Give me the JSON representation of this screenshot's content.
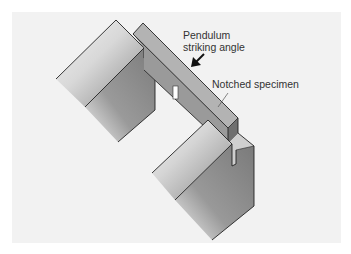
{
  "figure": {
    "labels": {
      "pendulum_line1": "Pendulum",
      "pendulum_line2": "striking angle",
      "notched_specimen": "Notched specimen"
    },
    "colors": {
      "background": "#f2f2f2",
      "outer_border": "#ffffff",
      "anvil_top": "#c8c8c8",
      "anvil_face_dark": "#7a7a7a",
      "specimen_top": "#a9a9a9",
      "specimen_side": "#8c8c8c",
      "outline": "#222222",
      "arrow": "#111111"
    }
  }
}
